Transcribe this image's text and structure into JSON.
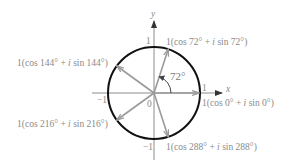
{
  "diagram": {
    "axes": {
      "x_label": "x",
      "y_label": "y",
      "ticks": {
        "x_pos": "1",
        "x_neg": "−1",
        "y_pos": "1",
        "y_neg": "−1",
        "origin": "0"
      }
    },
    "angle_marker": {
      "label": "72°",
      "degrees": 72
    },
    "vectors": [
      {
        "angle": 0,
        "label": "1(cos 0° + i sin 0°)",
        "label_parts": [
          "1(cos 0° + ",
          "i",
          " sin 0°)"
        ]
      },
      {
        "angle": 72,
        "label": "1(cos 72° + i sin 72°)",
        "label_parts": [
          "1(cos 72° + ",
          "i",
          " sin 72°)"
        ]
      },
      {
        "angle": 144,
        "label": "1(cos 144° + i sin 144°)",
        "label_parts": [
          "1(cos 144° + ",
          "i",
          " sin 144°)"
        ]
      },
      {
        "angle": 216,
        "label": "1(cos 216° + i sin 216°)",
        "label_parts": [
          "1(cos 216° + ",
          "i",
          " sin 216°)"
        ]
      },
      {
        "angle": 288,
        "label": "1(cos 288° + i sin 288°)",
        "label_parts": [
          "1(cos 288° + ",
          "i",
          " sin 288°)"
        ]
      }
    ],
    "colors": {
      "circle": "#111111",
      "axes": "#8c8c8c",
      "vectors": "#9a9a9a",
      "text": "#8a8a8a"
    }
  }
}
